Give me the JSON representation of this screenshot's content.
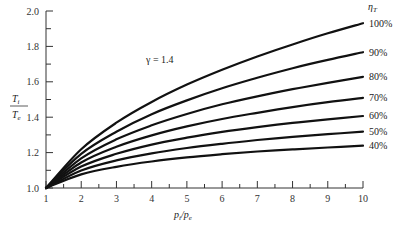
{
  "chart_data": {
    "type": "line",
    "title": "",
    "xlabel": "p_i/p_e",
    "ylabel": "T_i/T_e",
    "ylabel_numerator": "T",
    "ylabel_numerator_sub": "i",
    "ylabel_denominator": "T",
    "ylabel_denominator_sub": "e",
    "xlabel_num": "p",
    "xlabel_num_sub": "i",
    "xlabel_den": "p",
    "xlabel_den_sub": "e",
    "xlim": [
      1,
      10
    ],
    "ylim": [
      1.0,
      2.0
    ],
    "xticks": [
      1,
      2,
      3,
      4,
      5,
      6,
      7,
      8,
      9,
      10
    ],
    "xtick_labels": [
      "1",
      "2",
      "3",
      "4",
      "5",
      "6",
      "7",
      "8",
      "9",
      "10"
    ],
    "yticks": [
      1.0,
      1.2,
      1.4,
      1.6,
      1.8,
      2.0
    ],
    "ytick_labels": [
      "1.0",
      "1.2",
      "1.4",
      "1.6",
      "1.8",
      "2.0"
    ],
    "grid": false,
    "annotation": "γ = 1.4",
    "legend_title": "η",
    "legend_title_sub": "T",
    "legend_position": "right-inline",
    "x": [
      1,
      2,
      3,
      4,
      5,
      6,
      7,
      8,
      9,
      10
    ],
    "series": [
      {
        "name": "100%",
        "values": [
          1.0,
          1.219,
          1.369,
          1.486,
          1.584,
          1.668,
          1.743,
          1.811,
          1.874,
          1.931
        ]
      },
      {
        "name": "90%",
        "values": [
          1.0,
          1.193,
          1.318,
          1.417,
          1.495,
          1.564,
          1.623,
          1.677,
          1.724,
          1.767
        ]
      },
      {
        "name": "80%",
        "values": [
          1.0,
          1.168,
          1.275,
          1.354,
          1.418,
          1.473,
          1.518,
          1.558,
          1.594,
          1.628
        ]
      },
      {
        "name": "70%",
        "values": [
          1.0,
          1.144,
          1.233,
          1.297,
          1.348,
          1.39,
          1.425,
          1.457,
          1.485,
          1.509
        ]
      },
      {
        "name": "60%",
        "values": [
          1.0,
          1.121,
          1.193,
          1.245,
          1.284,
          1.317,
          1.344,
          1.368,
          1.388,
          1.407
        ]
      },
      {
        "name": "50%",
        "values": [
          1.0,
          1.099,
          1.156,
          1.196,
          1.226,
          1.25,
          1.271,
          1.289,
          1.304,
          1.318
        ]
      },
      {
        "name": "40%",
        "values": [
          1.0,
          1.077,
          1.12,
          1.15,
          1.173,
          1.191,
          1.206,
          1.218,
          1.229,
          1.239
        ]
      }
    ],
    "line_color": "#111111"
  }
}
